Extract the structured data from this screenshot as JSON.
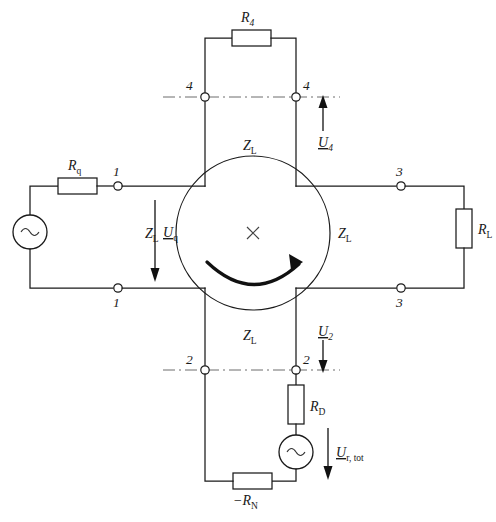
{
  "diagram": {
    "background_color": "#ffffff",
    "line_color": "#1a1a1a",
    "dash_line_color": "#6d6d6d"
  },
  "components": {
    "source_left": {
      "name": "ac-source-left",
      "symbol": "~",
      "voltage_label": "U",
      "voltage_sub": "q",
      "arrow_direction": "down"
    },
    "resistor_rq": {
      "name": "resistor-rq",
      "label": "R",
      "sub": "q"
    },
    "resistor_r4": {
      "name": "resistor-r4",
      "label": "R",
      "sub": "4"
    },
    "resistor_rl": {
      "name": "resistor-rl",
      "label": "R",
      "sub": "L"
    },
    "resistor_rd": {
      "name": "resistor-rd",
      "label": "R",
      "sub": "D"
    },
    "resistor_rn": {
      "name": "resistor-rn",
      "label": "−R",
      "sub": "N"
    },
    "source_bottom": {
      "name": "ac-source-bottom",
      "symbol": "~",
      "voltage_label": "U",
      "voltage_sub": "r, tot",
      "arrow_direction": "down"
    },
    "rotor": {
      "name": "rotating-machine",
      "center_mark": "×",
      "rotation_arrow": "clockwise"
    }
  },
  "impedance_labels": {
    "left": {
      "label": "Z",
      "sub": "L"
    },
    "right": {
      "label": "Z",
      "sub": "L"
    },
    "top": {
      "label": "Z",
      "sub": "L"
    },
    "bottom": {
      "label": "Z",
      "sub": "L"
    }
  },
  "port_labels": {
    "p1_top": "1",
    "p1_bottom": "1",
    "p2_left": "2",
    "p2_right": "2",
    "p3_top": "3",
    "p3_bottom": "3",
    "p4_left": "4",
    "p4_right": "4"
  },
  "voltage_arrows": {
    "u4": {
      "label": "U",
      "sub": "4",
      "direction": "up"
    },
    "u2": {
      "label": "U",
      "sub": "2",
      "direction": "down"
    }
  }
}
